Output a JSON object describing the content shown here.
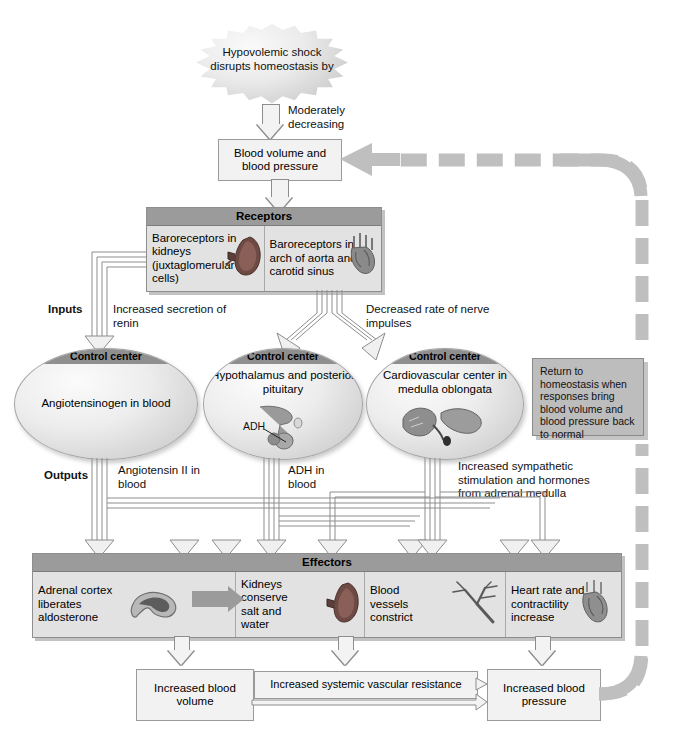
{
  "diagram": {
    "stimulus": "Hypovolemic shock disrupts homeostasis by",
    "stimulus_effect": "Moderately decreasing",
    "controlled_condition": "Blood volume and blood pressure",
    "inputs_label": "Inputs",
    "outputs_label": "Outputs",
    "receptors": {
      "header": "Receptors",
      "cells": [
        {
          "label": "Baroreceptors in kidneys (juxtaglomerular cells)",
          "icon": "kidney-illustration"
        },
        {
          "label": "Baroreceptors in arch of aorta and carotid sinus",
          "icon": "heart-aorta-illustration"
        }
      ]
    },
    "input_signals": [
      "Increased secretion of renin",
      "Decreased rate of nerve impulses"
    ],
    "control_centers": [
      {
        "header": "Control center",
        "body": "Angiotensinogen in blood",
        "icon": ""
      },
      {
        "header": "Control center",
        "body": "Hypothalamus and posterior pituitary",
        "icon": "pituitary-illustration",
        "icon_label": "ADH"
      },
      {
        "header": "Control center",
        "body": "Cardiovascular center in medulla oblongata",
        "icon": "brainstem-illustration"
      }
    ],
    "output_signals": [
      "Angiotensin II in blood",
      "ADH in blood",
      "Increased sympathetic stimulation and hormones from adrenal medulla"
    ],
    "effectors": {
      "header": "Effectors",
      "cells": [
        {
          "label": "Adrenal cortex liberates aldosterone",
          "icon": "adrenal-gland-illustration"
        },
        {
          "label": "Kidneys conserve salt and water",
          "icon": "kidney-illustration"
        },
        {
          "label": "Blood vessels constrict",
          "icon": "blood-vessel-illustration"
        },
        {
          "label": "Heart rate and contractility increase",
          "icon": "heart-illustration"
        }
      ]
    },
    "results": [
      "Increased blood volume",
      "Increased systemic vascular resistance",
      "Increased blood pressure"
    ],
    "return_note": "Return to homeostasis when responses bring blood volume and blood pressure back to normal",
    "colors": {
      "panel_header": "#9b9b9b",
      "panel_body": "#e2e2e2",
      "light_box": "#f2f2f2",
      "arrow_outline": "#8d8d8d",
      "feedback_band": "#bfbfbf"
    }
  }
}
